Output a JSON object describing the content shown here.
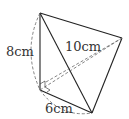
{
  "diagram": {
    "type": "3D tetrahedron / pyramid geometry figure",
    "labels": {
      "height": "8cm",
      "slant": "10cm",
      "base": "6cm"
    },
    "vertices": {
      "top": [
        40,
        13
      ],
      "right": [
        122,
        38
      ],
      "bottom_left": [
        40,
        90
      ],
      "bottom": [
        92,
        113
      ]
    },
    "colors": {
      "stroke": "#222222",
      "dashed": "#666666",
      "text": "#333333"
    }
  }
}
